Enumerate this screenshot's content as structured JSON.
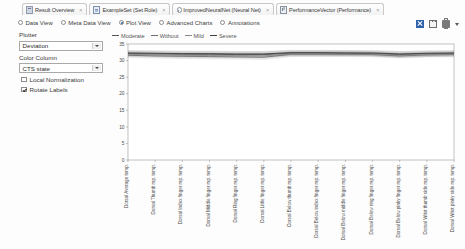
{
  "tabs": [
    {
      "label": "Result Overview",
      "icon": "result-overview-icon",
      "closable": true
    },
    {
      "label": "ExampleSet (Set Role)",
      "icon": "table-icon",
      "closable": true
    },
    {
      "label": "ImprovedNeuralNet (Neural Net)",
      "icon": "neural-net-icon",
      "closable": true
    },
    {
      "label": "PerformanceVector (Performance)",
      "icon": "performance-icon",
      "closable": true
    }
  ],
  "close_glyph": "×",
  "view_options": [
    {
      "label": "Data View",
      "selected": false
    },
    {
      "label": "Meta Data View",
      "selected": false
    },
    {
      "label": "Plot View",
      "selected": true
    },
    {
      "label": "Advanced Charts",
      "selected": false
    },
    {
      "label": "Annotations",
      "selected": false
    }
  ],
  "toolbar_icons": [
    {
      "name": "export-icon",
      "color": "#2f62a8"
    },
    {
      "name": "copy-icon",
      "color": "#6e6e6e"
    },
    {
      "name": "print-icon",
      "color": "#7a7a7a"
    },
    {
      "name": "dropdown-caret-icon",
      "color": "#5a5a5a"
    }
  ],
  "panel": {
    "plotter_label": "Plotter",
    "plotter_value": "Deviation",
    "color_column_label": "Color Column",
    "color_column_value": "CTS state",
    "local_normalization_label": "Local Normalization",
    "local_normalization_checked": false,
    "rotate_labels_label": "Rotate Labels",
    "rotate_labels_checked": true
  },
  "chart_data": {
    "type": "line",
    "title": "",
    "xlabel": "",
    "ylabel": "",
    "ylim": [
      0,
      35
    ],
    "yticks": [
      0,
      5,
      10,
      15,
      20,
      25,
      30,
      35
    ],
    "grid": false,
    "legend_position": "top-left",
    "rotated_xticks": true,
    "categories": [
      "Dorsal Average temp.",
      "Dorsal Thumb mp. temp.",
      "Dorsal Index finger mp. temp.",
      "Dorsal Middle finger mp. temp.",
      "Dorsal Ring finger mp. temp.",
      "Dorsal Little finger mp. temp.",
      "Dorsal Below thumb mp. temp.",
      "Dorsal Below index finger mp. temp.",
      "Dorsal Below middle finger mp. temp.",
      "Dorsal Below ring finger mp. temp.",
      "Dorsal Below pinky finger mp. temp.",
      "Dorsal Wrist thumb side mp. temp.",
      "Dorsal Wrist pinky side mp. temp."
    ],
    "series": [
      {
        "name": "Moderate",
        "color": "#555555",
        "values": [
          32.1,
          32.0,
          31.9,
          31.9,
          31.8,
          31.8,
          32.2,
          32.2,
          32.2,
          32.1,
          31.8,
          32.0,
          32.1
        ],
        "band": 0.9
      },
      {
        "name": "Without",
        "color": "#6f6f6f",
        "values": [
          31.6,
          31.4,
          31.3,
          31.2,
          31.1,
          31.0,
          31.9,
          31.9,
          31.9,
          31.8,
          31.4,
          31.7,
          31.8
        ],
        "band": 0.8
      },
      {
        "name": "Mild",
        "color": "#8a8a8a",
        "values": [
          31.9,
          31.7,
          31.6,
          31.5,
          31.5,
          31.4,
          32.0,
          32.0,
          32.0,
          32.0,
          31.6,
          31.9,
          31.9
        ],
        "band": 0.8
      },
      {
        "name": "Severe",
        "color": "#3d3d3d",
        "values": [
          32.3,
          32.2,
          32.1,
          32.1,
          32.0,
          32.0,
          32.4,
          32.4,
          32.3,
          32.3,
          32.0,
          32.2,
          32.3
        ],
        "band": 0.9
      }
    ]
  }
}
